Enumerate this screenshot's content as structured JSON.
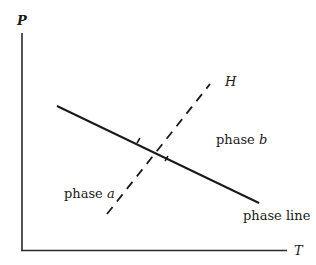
{
  "diagram": {
    "type": "phase diagram",
    "axes": {
      "y_label": "P",
      "x_label": "T"
    },
    "labels": {
      "dashed_line": "H",
      "region_b_prefix": "phase ",
      "region_b_var": "b",
      "region_a_prefix": "phase ",
      "region_a_var": "a",
      "phase_line": "phase line"
    },
    "colors": {
      "ink": "#1a1a1a",
      "background": "#ffffff"
    }
  }
}
